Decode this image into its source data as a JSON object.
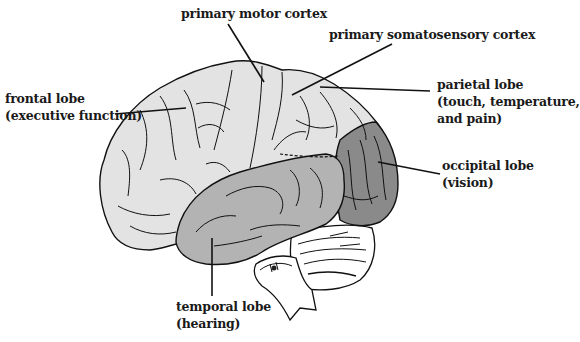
{
  "diagram": {
    "type": "labeled-illustration",
    "colors": {
      "background": "#ffffff",
      "frontal_parietal_fill": "#e3e3e3",
      "temporal_fill": "#b3b3b3",
      "occipital_fill": "#8a8a8a",
      "cerebellum_fill": "#ffffff",
      "outline": "#111111",
      "label_text": "#1a1a1a"
    },
    "labels": [
      {
        "id": "primary-motor-cortex",
        "lines": [
          "primary motor cortex"
        ]
      },
      {
        "id": "primary-somatosensory-cortex",
        "lines": [
          "primary somatosensory cortex"
        ]
      },
      {
        "id": "parietal-lobe",
        "lines": [
          "parietal lobe",
          "(touch, temperature,",
          "and pain)"
        ]
      },
      {
        "id": "frontal-lobe",
        "lines": [
          "frontal lobe",
          "(executive function)"
        ]
      },
      {
        "id": "occipital-lobe",
        "lines": [
          "occipital lobe",
          "(vision)"
        ]
      },
      {
        "id": "temporal-lobe",
        "lines": [
          "temporal lobe",
          "(hearing)"
        ]
      }
    ]
  }
}
